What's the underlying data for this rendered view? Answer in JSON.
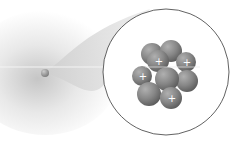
{
  "diagram": {
    "atom": {
      "label": "atom",
      "cx": 45,
      "cy": 73,
      "r": 4
    },
    "magnifier": {
      "label": "nucleus-zoom",
      "cx": 166,
      "cy": 72,
      "r": 63
    },
    "nucleus": {
      "particles": [
        {
          "type": "neutron",
          "cx": 152,
          "cy": 54,
          "r": 11,
          "sign": ""
        },
        {
          "type": "neutron",
          "cx": 171,
          "cy": 51,
          "r": 11,
          "sign": ""
        },
        {
          "type": "proton",
          "cx": 186,
          "cy": 62,
          "r": 10,
          "sign": "+"
        },
        {
          "type": "proton",
          "cx": 142,
          "cy": 76,
          "r": 10,
          "sign": "+"
        },
        {
          "type": "neutron",
          "cx": 187,
          "cy": 81,
          "r": 11,
          "sign": ""
        },
        {
          "type": "proton",
          "cx": 158,
          "cy": 61,
          "r": 11,
          "sign": "+"
        },
        {
          "type": "neutron",
          "cx": 167,
          "cy": 79,
          "r": 12,
          "sign": ""
        },
        {
          "type": "neutron",
          "cx": 149,
          "cy": 94,
          "r": 12,
          "sign": ""
        },
        {
          "type": "proton",
          "cx": 171,
          "cy": 98,
          "r": 11,
          "sign": "+"
        }
      ]
    },
    "axis_line": {
      "y": 67
    },
    "colors": {
      "particle": "#8a8a8a",
      "particle_dark": "#5e5e5e",
      "outline": "#333333",
      "sign": "#ffffff"
    }
  }
}
